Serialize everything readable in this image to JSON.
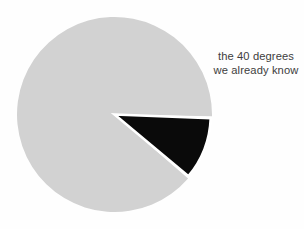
{
  "figure": {
    "background_color": "#fefefe",
    "annotation": {
      "line1": "the 40 degrees",
      "line2": "we already know",
      "text_color": "#3d3d3d"
    }
  },
  "chart_data": {
    "type": "pie",
    "title": "",
    "subtitle": "",
    "xlabel": "",
    "ylabel": "",
    "grid": false,
    "legend_position": "right-inline-annotation",
    "center_x": 114.5,
    "center_y": 114.5,
    "radius": 97.5,
    "start_angle_deg": -1,
    "direction": "clockwise",
    "wedge_gap_deg": 1.2,
    "slice_separator_color": "#ffffff",
    "slices": [
      {
        "label": "the 40 degrees we already know",
        "value": 40,
        "unit": "degrees",
        "fraction": 0.1111,
        "color": "#0a0a0a",
        "start_angle_deg": -1,
        "end_angle_deg": -41,
        "annotated": true
      },
      {
        "label": "",
        "value": 320,
        "unit": "degrees",
        "fraction": 0.8889,
        "color": "#d2d2d2",
        "start_angle_deg": -41,
        "end_angle_deg": -361,
        "annotated": false
      }
    ],
    "total_degrees": 360,
    "values": [
      40,
      320
    ],
    "categories": [
      "the 40 degrees we already know",
      ""
    ],
    "colors": [
      "#0a0a0a",
      "#d2d2d2"
    ]
  }
}
